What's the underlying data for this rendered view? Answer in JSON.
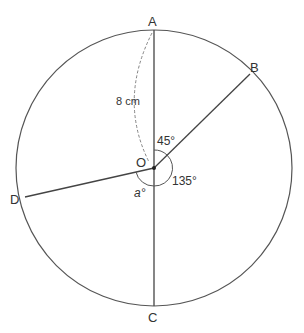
{
  "diagram": {
    "points": {
      "A": "A",
      "B": "B",
      "C": "C",
      "D": "D",
      "O": "O"
    },
    "radius_label": "8 cm",
    "angle_AOB": "45°",
    "angle_BOC": "135°",
    "angle_COD": "a°"
  }
}
